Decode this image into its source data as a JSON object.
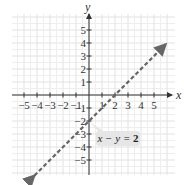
{
  "chart_data": {
    "type": "line",
    "title": "",
    "xlabel": "x",
    "ylabel": "y",
    "xlim": [
      -6,
      6
    ],
    "ylim": [
      -6,
      6
    ],
    "grid": true,
    "x_ticks": [
      "-5",
      "-4",
      "-3",
      "-2",
      "-1",
      "1",
      "2",
      "3",
      "4",
      "5"
    ],
    "y_ticks": [
      "5",
      "4",
      "3",
      "2",
      "1",
      "-1",
      "-2",
      "-3",
      "-4",
      "-5"
    ],
    "series": [
      {
        "name": "x - y = 2",
        "style": "dashed",
        "color": "#666666",
        "x": [
          -4.2,
          5.9
        ],
        "y": [
          -6.2,
          3.9
        ]
      }
    ],
    "annotations": [
      {
        "text_prefix": "x − y = ",
        "text_value": "2",
        "points_to": [
          0,
          -2
        ]
      }
    ],
    "intercepts": {
      "x": 2,
      "y": -2
    }
  }
}
